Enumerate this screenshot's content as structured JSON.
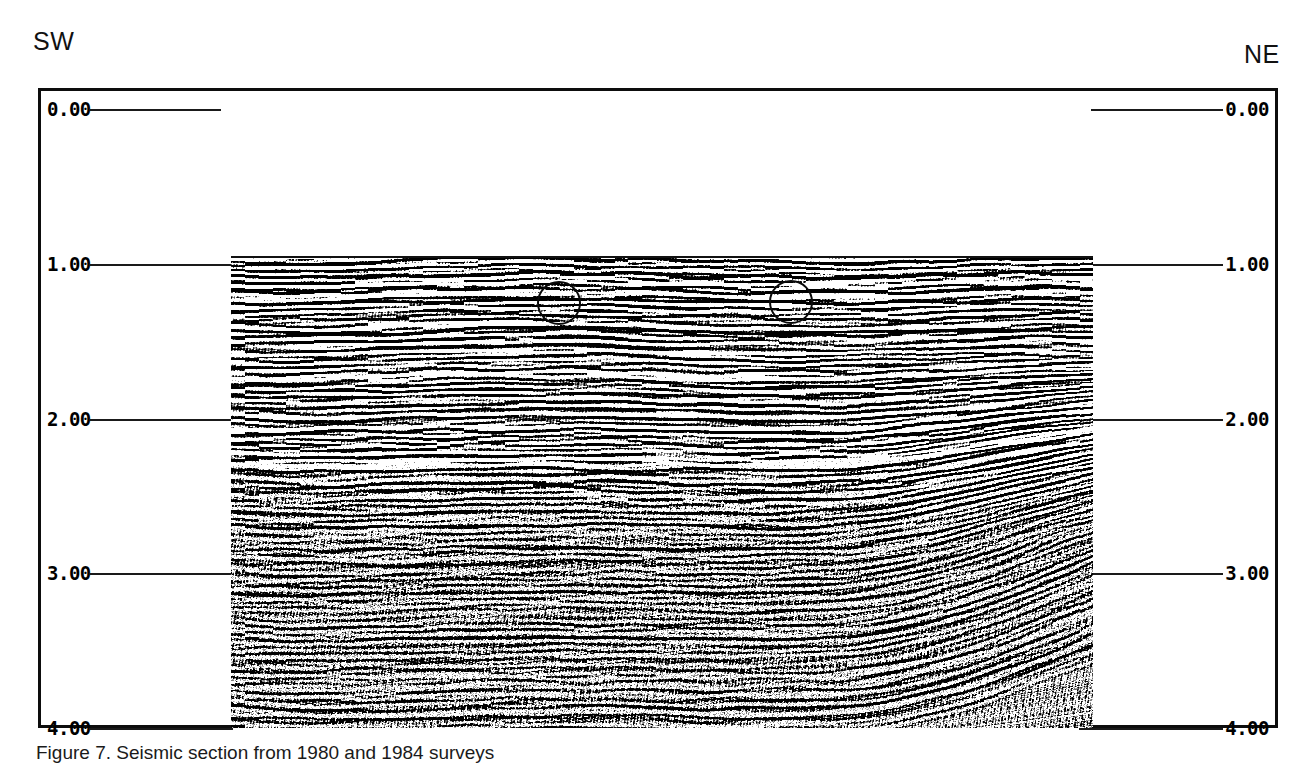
{
  "figure": {
    "panel_letter": "B",
    "orientation_left": "SW",
    "orientation_right": "NE",
    "caption": "Figure 7. Seismic section from 1980 and 1984 surveys",
    "scale_bar": {
      "label": "3 KM",
      "length_km": 3
    }
  },
  "axes": {
    "y_axis_unit": "seconds two-way travel time",
    "left_ticks": [
      {
        "label": "0.00",
        "value": 0.0
      },
      {
        "label": "1.00",
        "value": 1.0
      },
      {
        "label": "2.00",
        "value": 2.0
      },
      {
        "label": "3.00",
        "value": 3.0
      },
      {
        "label": "4.00",
        "value": 4.0
      }
    ],
    "right_ticks": [
      {
        "label": "0.00",
        "value": 0.0
      },
      {
        "label": "1.00",
        "value": 1.0
      },
      {
        "label": "2.00",
        "value": 2.0
      },
      {
        "label": "3.00",
        "value": 3.0
      },
      {
        "label": "4.00",
        "value": 4.0
      }
    ]
  },
  "annotations": [
    {
      "name": "circle-annotation-1",
      "shape": "circle"
    },
    {
      "name": "circle-annotation-2",
      "shape": "circle"
    }
  ],
  "colors": {
    "ink": "#000000",
    "frame": "#0d0d0d",
    "paper": "#ffffff"
  },
  "chart_data": {
    "type": "heatmap",
    "xlabel": "",
    "ylabel": "Two-way travel time (s)",
    "x_left_label": "SW",
    "x_right_label": "NE",
    "ylim": [
      0.0,
      4.0
    ],
    "y_ticks": [
      0.0,
      1.0,
      2.0,
      3.0,
      4.0
    ],
    "grid": false,
    "legend": "none",
    "data_extent": {
      "t_top": 1.0,
      "t_bottom": 4.0,
      "x_start_fraction": 0.153,
      "x_end_fraction": 0.847
    },
    "scale_bar_km": 3,
    "annotations": [
      {
        "type": "circle",
        "t_center": 1.3,
        "x_fraction": 0.38,
        "radius_s": 0.14
      },
      {
        "type": "circle",
        "t_center": 1.29,
        "x_fraction": 0.65,
        "radius_s": 0.14
      }
    ]
  }
}
